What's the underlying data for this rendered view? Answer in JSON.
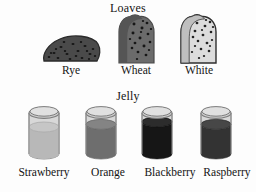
{
  "page": {
    "background_color": "#fdfdfd",
    "text_color": "#141414",
    "width": 256,
    "height": 192
  },
  "sections": [
    {
      "id": "loaves",
      "title": "Loaves",
      "items": [
        {
          "name": "Rye",
          "icon": "bread-slice-rye-icon",
          "shape": "half-dome-oval",
          "crust_color": "#3d3d3d",
          "crumb_color": "#4a4a4a",
          "speckle_color": "#1c1c1c",
          "speckle_count": 21,
          "description": "dark rounded rye slice with seeds"
        },
        {
          "name": "Wheat",
          "icon": "bread-slice-wheat-icon",
          "shape": "sandwich-slice",
          "crust_color": "#5a5a5a",
          "crumb_color": "#6b6b6b",
          "speckle_color": "#1d1d1d",
          "speckle_count": 18,
          "description": "medium-gray wheat sandwich slice with grain specks"
        },
        {
          "name": "White",
          "icon": "bread-slice-white-icon",
          "shape": "sandwich-slice",
          "crust_color": "#3a3a3a",
          "crumb_color": "#dcdcdc",
          "speckle_color": "#262626",
          "speckle_count": 20,
          "description": "light white sandwich slice with dark outline and specks"
        }
      ]
    },
    {
      "id": "jelly",
      "title": "Jelly",
      "items": [
        {
          "name": "Strawberry",
          "icon": "jelly-jar-icon",
          "fill_color": "#b8b8b8",
          "fill_level_percent": 56,
          "glass_color": "#d8d8d8",
          "rim_color": "#9a9a9a"
        },
        {
          "name": "Orange",
          "icon": "jelly-jar-icon",
          "fill_color": "#6e6e6e",
          "fill_level_percent": 62,
          "glass_color": "#d8d8d8",
          "rim_color": "#9a9a9a"
        },
        {
          "name": "Blackberry",
          "icon": "jelly-jar-icon",
          "fill_color": "#161616",
          "fill_level_percent": 68,
          "glass_color": "#d8d8d8",
          "rim_color": "#9a9a9a"
        },
        {
          "name": "Raspberry",
          "icon": "jelly-jar-icon",
          "fill_color": "#333333",
          "fill_level_percent": 62,
          "glass_color": "#d8d8d8",
          "rim_color": "#9a9a9a"
        }
      ]
    }
  ]
}
